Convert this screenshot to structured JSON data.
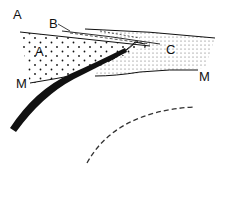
{
  "diagram": {
    "type": "geological cross-section",
    "labels": {
      "top_left": "A",
      "wedge": "B",
      "block_a": "A",
      "block_c": "C",
      "boundary_left": "M",
      "boundary_right": "M"
    },
    "colors": {
      "ink": "#111111",
      "dashed": "#333333",
      "background": "#ffffff"
    }
  }
}
